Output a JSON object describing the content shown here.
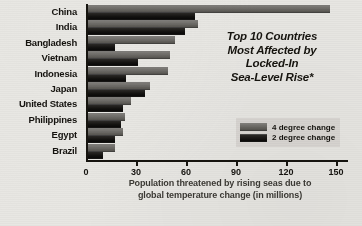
{
  "chart_data": {
    "type": "bar",
    "orientation": "horizontal",
    "title_lines": [
      "Top 10 Countries",
      "Most Affected by",
      "Locked-In",
      "Sea-Level Rise*"
    ],
    "xlabel": "Population threatened by rising seas due to global temperature change (in millions)",
    "xlabel_lines": [
      "Population threatened by rising seas due to",
      "global temperature change (in millions)"
    ],
    "ylabel": "",
    "categories": [
      "China",
      "India",
      "Bangladesh",
      "Vietnam",
      "Indonesia",
      "Japan",
      "United States",
      "Philippines",
      "Egypt",
      "Brazil"
    ],
    "series": [
      {
        "name": "4 degree change",
        "color": "#6a6864",
        "values": [
          145,
          66,
          52,
          49,
          48,
          37,
          26,
          22,
          21,
          16
        ]
      },
      {
        "name": "2 degree change",
        "color": "#131210",
        "values": [
          64,
          58,
          16,
          30,
          23,
          34,
          21,
          20,
          16,
          9
        ]
      }
    ],
    "xlim": [
      0,
      150
    ],
    "xticks": [
      0,
      30,
      60,
      90,
      120,
      150
    ],
    "xtick_labels": [
      "0",
      "30",
      "60",
      "90",
      "120",
      "150"
    ],
    "grid": false,
    "legend_position": "center-right",
    "background_color": "#e8e7e3",
    "axis_color": "#16140f"
  }
}
